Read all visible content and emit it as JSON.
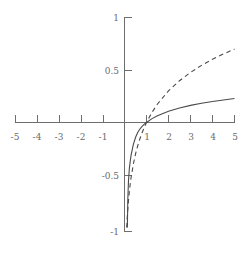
{
  "chart_data": {
    "type": "line",
    "title": "",
    "xlabel": "",
    "ylabel": "",
    "xlim": [
      -5,
      5
    ],
    "ylim": [
      -1,
      1
    ],
    "grid": false,
    "legend": "none",
    "x_ticks": [
      -5,
      -4,
      -3,
      -2,
      -1,
      1,
      2,
      3,
      4,
      5
    ],
    "x_tick_labels": [
      "-5",
      "-4",
      "-3",
      "-2",
      "-1",
      "1",
      "2",
      "3",
      "4",
      "5"
    ],
    "y_ticks": [
      -1,
      -0.5,
      0.5,
      1
    ],
    "y_tick_labels": [
      "-1",
      "-0.5",
      "0.5",
      "1"
    ],
    "axes_style": "crossed-at-origin",
    "series": [
      {
        "name": "solid-curve",
        "style": "solid",
        "color": "#4a4a4a",
        "description": "slow-growing logarithmic curve through (1, 0)",
        "x": [
          0.13,
          0.15,
          0.18,
          0.22,
          0.26,
          0.3,
          0.35,
          0.4,
          0.5,
          0.6,
          0.7,
          0.8,
          0.9,
          1.0,
          1.25,
          1.5,
          2.0,
          2.5,
          3.0,
          3.5,
          4.0,
          4.5,
          5.0
        ],
        "y": [
          -1.0,
          -0.74,
          -0.56,
          -0.44,
          -0.37,
          -0.31,
          -0.26,
          -0.21,
          -0.143,
          -0.096,
          -0.062,
          -0.036,
          -0.016,
          0.0,
          0.037,
          0.065,
          0.108,
          0.139,
          0.163,
          0.183,
          0.2,
          0.215,
          0.228
        ]
      },
      {
        "name": "dashed-curve",
        "style": "dashed",
        "color": "#4a4a4a",
        "description": "log base 10 curve through (1, 0)",
        "x": [
          0.1,
          0.13,
          0.16,
          0.2,
          0.25,
          0.3,
          0.4,
          0.5,
          0.6,
          0.7,
          0.8,
          0.9,
          1.0,
          1.25,
          1.5,
          2.0,
          2.5,
          3.0,
          3.5,
          4.0,
          4.5,
          5.0
        ],
        "y": [
          -1.0,
          -0.886,
          -0.796,
          -0.699,
          -0.602,
          -0.523,
          -0.398,
          -0.301,
          -0.222,
          -0.155,
          -0.097,
          -0.046,
          0.0,
          0.097,
          0.176,
          0.301,
          0.398,
          0.477,
          0.544,
          0.602,
          0.653,
          0.699
        ]
      }
    ]
  },
  "axis_labels": {
    "x": {
      "neg5": "-5",
      "neg4": "-4",
      "neg3": "-3",
      "neg2": "-2",
      "neg1": "-1",
      "pos1": "1",
      "pos2": "2",
      "pos3": "3",
      "pos4": "4",
      "pos5": "5"
    },
    "y": {
      "pos1": "1",
      "pos05": "0.5",
      "neg05": "-0.5",
      "neg1": "-1"
    }
  }
}
